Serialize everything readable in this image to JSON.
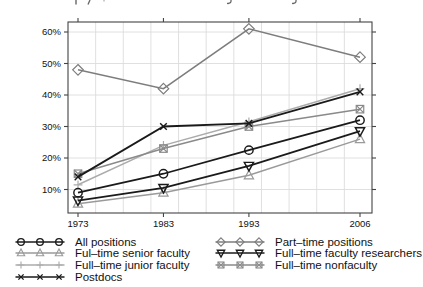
{
  "chart_data": {
    "type": "line",
    "x": [
      1973,
      1983,
      1993,
      2006
    ],
    "x_tick_labels": [
      "1973",
      "1983",
      "1993",
      "2006"
    ],
    "y_tick_values": [
      10,
      20,
      30,
      40,
      50,
      60
    ],
    "y_tick_labels": [
      "10%",
      "20%",
      "30%",
      "40%",
      "50%",
      "60%"
    ],
    "xlim": [
      1971.8,
      2007.4
    ],
    "ylim": [
      2.5,
      63.5
    ],
    "grid": true,
    "legend_position": "bottom",
    "frame_color": "#444444",
    "grid_color": "#dddddd",
    "text_color": "#111111",
    "series": [
      {
        "name": "All positions",
        "marker": "circle",
        "color": "#1a1a1a",
        "values": [
          9,
          15,
          22.5,
          32
        ]
      },
      {
        "name": "Ful–time senior faculty",
        "marker": "triangle-up",
        "color": "#9a9a9a",
        "values": [
          5.5,
          9,
          14.5,
          26
        ]
      },
      {
        "name": "Full–time junior faculty",
        "marker": "plus",
        "color": "#ababab",
        "values": [
          11.5,
          24,
          31.5,
          42
        ]
      },
      {
        "name": "Postdocs",
        "marker": "x",
        "color": "#1a1a1a",
        "values": [
          14,
          30,
          31,
          41
        ]
      },
      {
        "name": "Part–time positions",
        "marker": "diamond",
        "color": "#7d7d7d",
        "values": [
          48,
          42,
          61,
          52
        ]
      },
      {
        "name": "Full–time faculty researchers",
        "marker": "triangle-down",
        "color": "#1a1a1a",
        "values": [
          6.5,
          10.5,
          17.5,
          28.5
        ]
      },
      {
        "name": "Full–time nonfaculty",
        "marker": "square-x",
        "color": "#8a8a8a",
        "values": [
          15,
          23,
          30,
          35.5
        ]
      }
    ],
    "legend_columns": [
      [
        0,
        1,
        2,
        3
      ],
      [
        4,
        5,
        6
      ]
    ],
    "draw_order": [
      2,
      1,
      6,
      4,
      0,
      5,
      3
    ]
  }
}
